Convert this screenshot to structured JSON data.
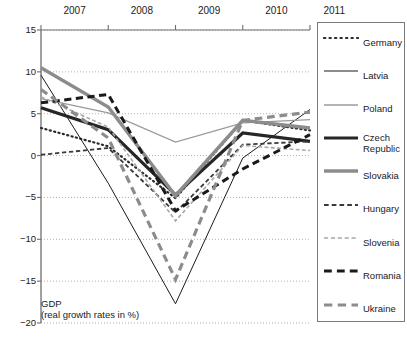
{
  "chart_data": {
    "type": "line",
    "title": "",
    "subtitle": "",
    "annotation_line1": "GDP",
    "annotation_line2": "(real growth rates in %)",
    "xlabel": "",
    "ylabel": "",
    "x": [
      "2007",
      "2008",
      "2009",
      "2010",
      "2011"
    ],
    "categories": [
      "2007",
      "2008",
      "2009",
      "2010",
      "2011"
    ],
    "ylim": [
      -20,
      15
    ],
    "xlim": [
      2007,
      2011
    ],
    "ytick_labels": [
      "15",
      "10",
      "5",
      "0",
      "−5",
      "−10",
      "−15",
      "−20"
    ],
    "ytick_values": [
      15,
      10,
      5,
      0,
      -5,
      -10,
      -15,
      -20
    ],
    "grid": "horizontal-dotted",
    "legend_position": "right-outside-box",
    "series": [
      {
        "name": "Germany",
        "values": [
          3.3,
          1.1,
          -5.1,
          4.2,
          3.0
        ],
        "color": "#2b2b2b",
        "style": "dotted",
        "width": 2.2
      },
      {
        "name": "Latvia",
        "values": [
          9.6,
          -3.3,
          -17.7,
          -0.3,
          5.5
        ],
        "color": "#1a1a1a",
        "style": "solid",
        "width": 1.0
      },
      {
        "name": "Poland",
        "values": [
          6.8,
          5.1,
          1.6,
          3.9,
          4.3
        ],
        "color": "#9a9a9a",
        "style": "solid",
        "width": 1.3
      },
      {
        "name": "Czech Republic",
        "values": [
          5.7,
          3.1,
          -4.7,
          2.7,
          1.7
        ],
        "color": "#262626",
        "style": "solid",
        "width": 3.2
      },
      {
        "name": "Slovakia",
        "values": [
          10.5,
          5.8,
          -4.8,
          4.2,
          3.3
        ],
        "color": "#8c8c8c",
        "style": "solid",
        "width": 3.4
      },
      {
        "name": "Hungary",
        "values": [
          0.1,
          0.9,
          -6.8,
          1.3,
          1.7
        ],
        "color": "#3a3a3a",
        "style": "dashed",
        "width": 1.8
      },
      {
        "name": "Slovenia",
        "values": [
          7.0,
          3.4,
          -7.8,
          1.2,
          0.6
        ],
        "color": "#a8a8a8",
        "style": "dashed",
        "width": 1.6
      },
      {
        "name": "Romania",
        "values": [
          6.3,
          7.3,
          -6.6,
          -1.6,
          2.5
        ],
        "color": "#1a1a1a",
        "style": "dashed",
        "width": 3.0
      },
      {
        "name": "Ukraine",
        "values": [
          7.9,
          2.1,
          -14.8,
          4.2,
          5.2
        ],
        "color": "#8c8c8c",
        "style": "dashed",
        "width": 3.2
      }
    ]
  },
  "axes": {
    "y_ticks": [
      {
        "label": "15",
        "value": 15
      },
      {
        "label": "10",
        "value": 10
      },
      {
        "label": "5",
        "value": 5
      },
      {
        "label": "0",
        "value": 0
      },
      {
        "label": "−5",
        "value": -5
      },
      {
        "label": "−10",
        "value": -10
      },
      {
        "label": "−15",
        "value": -15
      },
      {
        "label": "−20",
        "value": -20
      }
    ],
    "x_ticks": [
      {
        "label": "2007"
      },
      {
        "label": "2008"
      },
      {
        "label": "2009"
      },
      {
        "label": "2010"
      },
      {
        "label": "2011"
      }
    ]
  },
  "legend": {
    "items": [
      {
        "label": "Germany"
      },
      {
        "label": "Latvia"
      },
      {
        "label": "Poland"
      },
      {
        "label": "Czech Republic"
      },
      {
        "label": "Slovakia"
      },
      {
        "label": "Hungary"
      },
      {
        "label": "Slovenia"
      },
      {
        "label": "Romania"
      },
      {
        "label": "Ukraine"
      }
    ]
  },
  "annotation": {
    "line1": "GDP",
    "line2": "(real growth rates in %)"
  }
}
